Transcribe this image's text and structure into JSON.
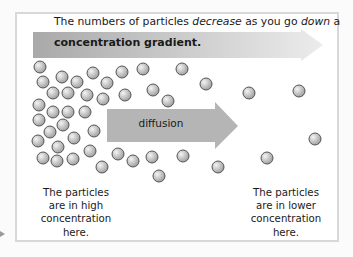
{
  "diagram": {
    "headline": {
      "prefix": "The numbers of particles ",
      "em1": "decrease",
      "middle": " as you go ",
      "em2": "down",
      "suffix": " a"
    },
    "gradient_arrow": {
      "label": "concentration gradient.",
      "color_start": "#a9a9a9",
      "color_end": "#ececec"
    },
    "diffusion_arrow": {
      "label": "diffusion",
      "color": "#b5b5b5"
    },
    "captions": {
      "left": [
        "The particles",
        "are in high",
        "concentration",
        "here."
      ],
      "right": [
        "The particles",
        "are in lower",
        "concentration",
        "here."
      ]
    },
    "particle_radius": 6,
    "particle_color": "#b8b8b8",
    "particle_stroke": "#555555",
    "particles": [
      [
        40,
        67
      ],
      [
        43,
        82
      ],
      [
        62,
        77
      ],
      [
        77,
        82
      ],
      [
        93,
        73
      ],
      [
        107,
        83
      ],
      [
        122,
        72
      ],
      [
        143,
        69
      ],
      [
        53,
        93
      ],
      [
        68,
        93
      ],
      [
        87,
        95
      ],
      [
        103,
        99
      ],
      [
        125,
        95
      ],
      [
        153,
        90
      ],
      [
        168,
        101
      ],
      [
        39,
        105
      ],
      [
        53,
        112
      ],
      [
        68,
        112
      ],
      [
        85,
        112
      ],
      [
        39,
        120
      ],
      [
        50,
        132
      ],
      [
        63,
        125
      ],
      [
        74,
        138
      ],
      [
        94,
        131
      ],
      [
        38,
        141
      ],
      [
        58,
        147
      ],
      [
        43,
        158
      ],
      [
        57,
        161
      ],
      [
        73,
        159
      ],
      [
        90,
        151
      ],
      [
        102,
        167
      ],
      [
        118,
        154
      ],
      [
        133,
        161
      ],
      [
        152,
        157
      ],
      [
        159,
        176
      ],
      [
        182,
        69
      ],
      [
        206,
        84
      ],
      [
        249,
        93
      ],
      [
        299,
        91
      ],
      [
        315,
        139
      ],
      [
        267,
        158
      ],
      [
        183,
        156
      ],
      [
        218,
        167
      ]
    ]
  }
}
